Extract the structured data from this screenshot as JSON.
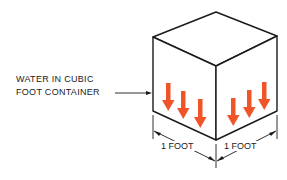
{
  "diagram": {
    "callout": {
      "line1": "WATER IN CUBIC",
      "line2": "FOOT CONTAINER"
    },
    "dimensions": {
      "left_label": "1 FOOT",
      "right_label": "1 FOOT"
    },
    "cube": {
      "shape": "isometric-cube",
      "stroke_color": "#1a1a1a",
      "fill_color": "#ffffff"
    },
    "pressure_arrows": {
      "icon": "down-arrow-icon",
      "color": "#f0552a",
      "left_face_count": 3,
      "right_face_count": 3,
      "direction": "down"
    }
  }
}
